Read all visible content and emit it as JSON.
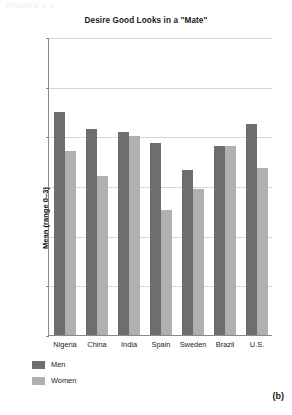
{
  "figure_label": "FIGURE 4.6",
  "panel_label": "(b)",
  "legend": {
    "items": [
      {
        "label": "Men",
        "color": "#6e6e6e"
      },
      {
        "label": "Women",
        "color": "#b0b0b0"
      }
    ]
  },
  "chart_data": {
    "type": "bar",
    "title": "Desire Good Looks in a \"Mate\"",
    "xlabel": "",
    "ylabel": "Mean (range 0–3)",
    "ylim": [
      0,
      3
    ],
    "yticks": [
      "0",
      "0.5",
      "1",
      "1.5",
      "2",
      "2.5",
      "3"
    ],
    "grid": true,
    "legend_position": "bottom-left",
    "categories": [
      "Nigeria",
      "China",
      "India",
      "Spain",
      "Sweden",
      "Brazil",
      "U.S."
    ],
    "series": [
      {
        "name": "Men",
        "color": "#6e6e6e",
        "values": [
          2.25,
          2.07,
          2.04,
          1.93,
          1.66,
          1.9,
          2.12
        ]
      },
      {
        "name": "Women",
        "color": "#b0b0b0",
        "values": [
          1.85,
          1.6,
          2.0,
          1.26,
          1.47,
          1.9,
          1.68
        ]
      }
    ]
  }
}
